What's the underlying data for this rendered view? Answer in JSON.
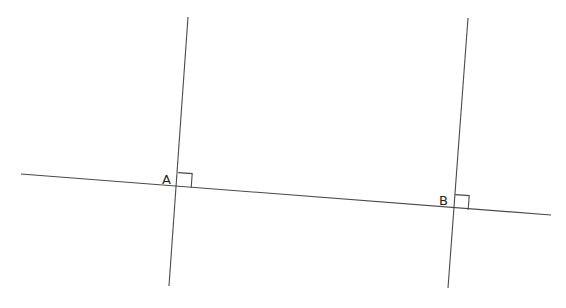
{
  "diagram": {
    "stroke_color": "#4a4a4a",
    "background": "#ffffff",
    "lines": [
      {
        "id": "transversal",
        "x1": 21,
        "y1": 174,
        "x2": 551,
        "y2": 215
      },
      {
        "id": "perpendicular-a",
        "x1": 188,
        "y1": 17,
        "x2": 169,
        "y2": 286
      },
      {
        "id": "perpendicular-b",
        "x1": 468,
        "y1": 18,
        "x2": 448,
        "y2": 288
      }
    ],
    "points": [
      {
        "label": "A",
        "x": 177,
        "y": 187
      },
      {
        "label": "B",
        "x": 453,
        "y": 208
      }
    ],
    "right_angle_markers": [
      "A",
      "B"
    ]
  }
}
